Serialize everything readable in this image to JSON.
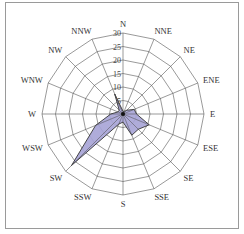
{
  "chart_data": {
    "type": "radar",
    "subtype": "wind-rose",
    "title": "",
    "categories": [
      "N",
      "NNE",
      "NE",
      "ENE",
      "E",
      "ESE",
      "SE",
      "SSE",
      "S",
      "SSW",
      "SW",
      "WSW",
      "W",
      "WNW",
      "NW",
      "NNW"
    ],
    "series": [
      {
        "name": "frequency",
        "values": [
          1,
          1,
          2,
          4.5,
          5,
          10.5,
          8,
          8.5,
          3,
          4,
          27,
          11,
          4.5,
          2,
          2,
          8
        ],
        "fill": "#a6a3d6",
        "stroke": "#333333"
      }
    ],
    "radial_ticks": [
      5,
      10,
      15,
      20,
      25,
      30
    ],
    "radial_tick_labels": [
      "5",
      "10",
      "15",
      "20",
      "25",
      "30"
    ],
    "rlim": [
      0,
      30
    ],
    "grid": true,
    "grid_shape": "polygon",
    "legend": null
  },
  "colors": {
    "grid": "#555555",
    "area_fill": "#a6a3d6",
    "area_stroke": "#333333",
    "frame": "#9a9a9a"
  }
}
